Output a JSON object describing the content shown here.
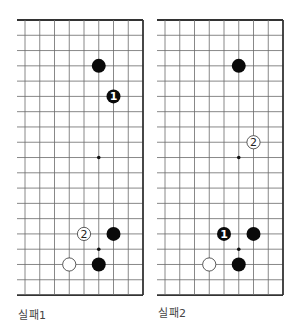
{
  "diagrams": [
    {
      "id": "fail-1",
      "caption": "실패1",
      "origin_x": 25,
      "caption_x": 18,
      "stones": [
        {
          "col": 5,
          "row": 3,
          "color": "black",
          "label": ""
        },
        {
          "col": 6,
          "row": 5,
          "color": "black",
          "label": "1"
        },
        {
          "col": 4,
          "row": 14,
          "color": "white",
          "label": "2"
        },
        {
          "col": 6,
          "row": 14,
          "color": "black",
          "label": ""
        },
        {
          "col": 3,
          "row": 16,
          "color": "white",
          "label": ""
        },
        {
          "col": 5,
          "row": 16,
          "color": "black",
          "label": ""
        }
      ],
      "star_points": [
        {
          "col": 5,
          "row": 9
        },
        {
          "col": 5,
          "row": 15
        }
      ]
    },
    {
      "id": "fail-2",
      "caption": "실패2",
      "origin_x": 165,
      "caption_x": 158,
      "stones": [
        {
          "col": 5,
          "row": 3,
          "color": "black",
          "label": ""
        },
        {
          "col": 6,
          "row": 8,
          "color": "white",
          "label": "2"
        },
        {
          "col": 4,
          "row": 14,
          "color": "black",
          "label": "1"
        },
        {
          "col": 6,
          "row": 14,
          "color": "black",
          "label": ""
        },
        {
          "col": 3,
          "row": 16,
          "color": "white",
          "label": ""
        },
        {
          "col": 5,
          "row": 16,
          "color": "black",
          "label": ""
        }
      ],
      "star_points": [
        {
          "col": 5,
          "row": 9
        },
        {
          "col": 5,
          "row": 15
        }
      ]
    }
  ],
  "grid": {
    "columns": 9,
    "rows": 19,
    "col_step": 14.75,
    "row_step": 15.28,
    "origin_y": 20,
    "left_overhang": 8,
    "line_color": "#6a6a6a",
    "edge_color": "#333333"
  },
  "colors": {
    "black_stone": "#0a0a0a",
    "white_stone": "#ffffff",
    "stone_outline": "#333333"
  }
}
